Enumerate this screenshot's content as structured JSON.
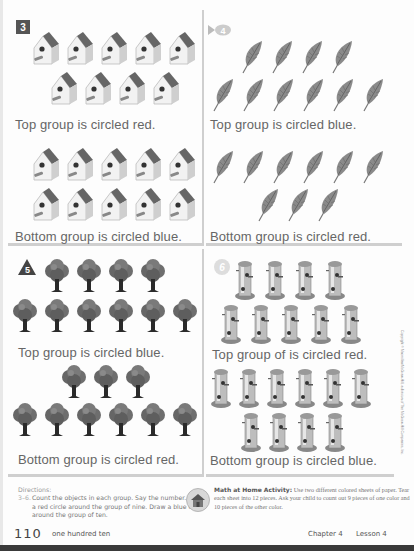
{
  "problems": [
    {
      "number": "3",
      "badge_shape": "square",
      "object": "birdhouse",
      "top_group": {
        "rows": [
          5,
          4
        ],
        "count": 9,
        "caption": "Top group is circled red."
      },
      "bottom_group": {
        "rows": [
          5,
          5
        ],
        "count": 10,
        "caption": "Bottom group is circled blue."
      }
    },
    {
      "number": "4",
      "badge_shape": "fish",
      "object": "feather",
      "top_group": {
        "rows": [
          4,
          6
        ],
        "count": 10,
        "caption": "Top group is circled blue."
      },
      "bottom_group": {
        "rows": [
          6,
          3
        ],
        "count": 9,
        "caption": "Bottom group is circled red."
      }
    },
    {
      "number": "5",
      "badge_shape": "triangle",
      "object": "tree",
      "top_group": {
        "rows": [
          4,
          6
        ],
        "count": 10,
        "caption": "Top group is circled blue."
      },
      "bottom_group": {
        "rows": [
          3,
          6
        ],
        "count": 9,
        "caption": "Bottom group is circled red."
      }
    },
    {
      "number": "6",
      "badge_shape": "circle",
      "object": "bird-feeder",
      "top_group": {
        "rows": [
          4,
          5
        ],
        "count": 9,
        "caption": "Top group of is circled red."
      },
      "bottom_group": {
        "rows": [
          6,
          4
        ],
        "count": 10,
        "caption": "Bottom group is circled blue."
      }
    }
  ],
  "directions": {
    "title": "Directions:",
    "range": "3–6.",
    "text": "Count the objects in each group. Say the number. Draw a red circle around the group of nine. Draw a blue circle around the group of ten."
  },
  "home_activity": {
    "title": "Math at Home Activity:",
    "text": "Use two different colored sheets of paper. Tear each sheet into 12 pieces. Ask your child to count out 9 pieces of one color and 10 pieces of the other color."
  },
  "footer": {
    "page_number": "110",
    "page_words": "one hundred ten",
    "chapter": "Chapter 4",
    "lesson": "Lesson 4"
  },
  "copyright": "Copyright © Macmillan/McGraw-Hill, a division of The McGraw-Hill Companies, Inc.",
  "colors": {
    "border": "#cfcfcf",
    "text": "#666666",
    "icon_dark": "#555555",
    "bottom_bar": "#3a3a3a"
  }
}
